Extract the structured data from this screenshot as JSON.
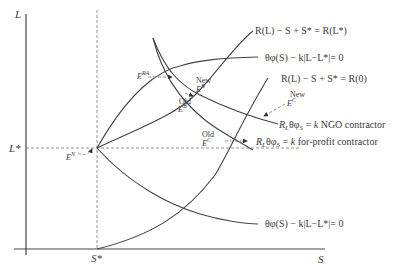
{
  "diagram": {
    "axes": {
      "y_label": "L",
      "x_label": "S",
      "y_tick": "L*",
      "x_tick": "S*"
    },
    "curves": [
      {
        "id": "R_Lstar",
        "label": "R(L) − S + S* = R(L*)"
      },
      {
        "id": "theta_upper",
        "label": "θφ(S) − k|L−L*|= 0"
      },
      {
        "id": "R_zero",
        "label": "R(L) − S + S* = R(0)"
      },
      {
        "id": "ngo",
        "label": "R_Lθφ_S = k NGO contractor"
      },
      {
        "id": "forprofit",
        "label": "R_Lθφ_S = k for-profit contractor"
      },
      {
        "id": "theta_lower",
        "label": "θφ(S) − k|L−L*|= 0"
      }
    ],
    "points": [
      {
        "id": "E_RA",
        "label": "E",
        "sup": "RA"
      },
      {
        "id": "E_B_new",
        "prefix": "New",
        "label": "E",
        "sup": "B"
      },
      {
        "id": "E_B_old",
        "prefix": "Old",
        "label": "E",
        "sup": "B"
      },
      {
        "id": "E_C_new",
        "prefix": "New",
        "label": "E",
        "sup": "C"
      },
      {
        "id": "E_C_old",
        "prefix": "Old",
        "label": "E",
        "sup": "C"
      },
      {
        "id": "E_N",
        "label": "E",
        "sup": "N"
      }
    ],
    "labels": {
      "R_Lstar_main": "R(L) − S + S* = R(L*)",
      "theta_upper": "θφ(S) − k|L−L*|= 0",
      "R_zero": "R(L) − S + S* = R(0)",
      "ngo_pre": "R",
      "ngo_sub1": "L",
      "ngo_mid": "θφ",
      "ngo_sub2": "S",
      "ngo_post": " = k NGO contractor",
      "fp_post": " = k for-profit contractor",
      "theta_lower": "θφ(S) − k|L−L*|= 0",
      "new": "New",
      "old": "Old",
      "E": "E"
    }
  }
}
